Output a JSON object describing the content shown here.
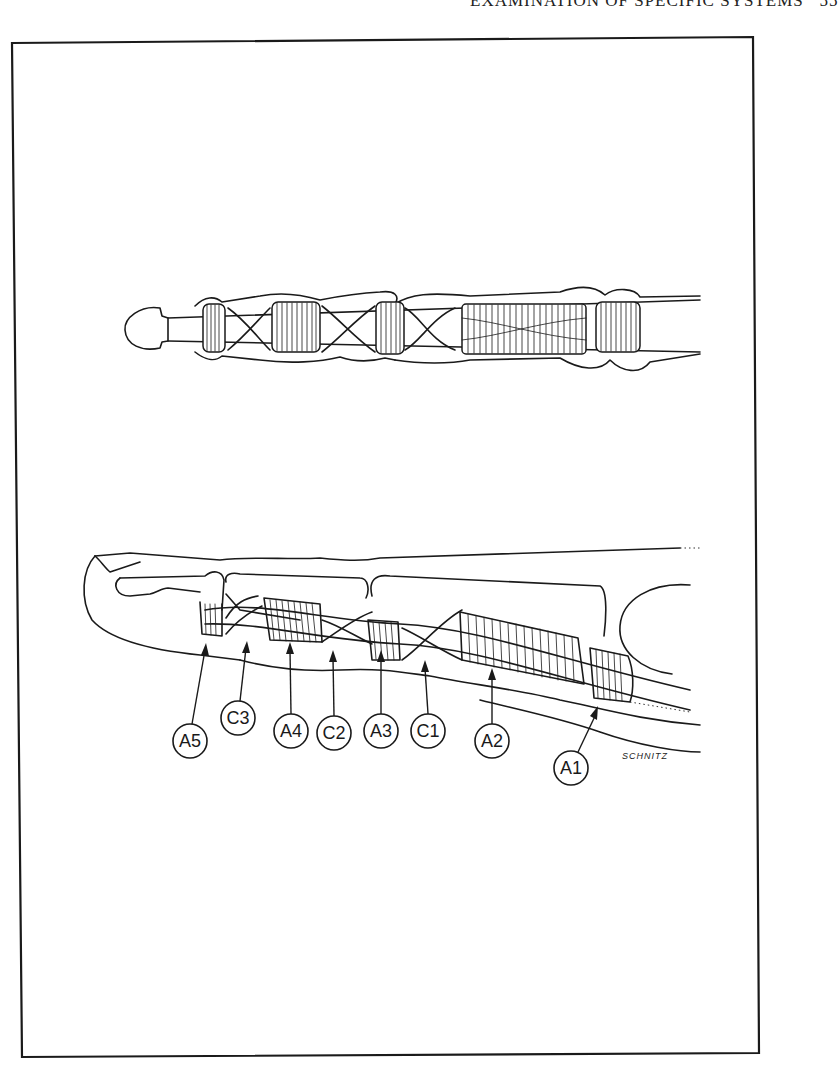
{
  "page": {
    "header_fragment": "EXAMINATION OF SPECIFIC SYSTEMS",
    "page_number_fragment": "55"
  },
  "figure": {
    "top_view": {
      "description": "Palmar view of finger flexor tendon sheath pulleys"
    },
    "lateral_view": {
      "description": "Lateral view of finger flexor sheath with annular and cruciate pulleys",
      "labels": [
        {
          "id": "A5",
          "text": "A5",
          "cx": 190,
          "cy": 741,
          "tip_x": 206,
          "tip_y": 645
        },
        {
          "id": "C3",
          "text": "C3",
          "cx": 238,
          "cy": 718,
          "tip_x": 246,
          "tip_y": 641
        },
        {
          "id": "A4",
          "text": "A4",
          "cx": 291,
          "cy": 731,
          "tip_x": 290,
          "tip_y": 642
        },
        {
          "id": "C2",
          "text": "C2",
          "cx": 334,
          "cy": 733,
          "tip_x": 333,
          "tip_y": 650
        },
        {
          "id": "A3",
          "text": "A3",
          "cx": 381,
          "cy": 731,
          "tip_x": 381,
          "tip_y": 650
        },
        {
          "id": "C1",
          "text": "C1",
          "cx": 428,
          "cy": 731,
          "tip_x": 425,
          "tip_y": 660
        },
        {
          "id": "A2",
          "text": "A2",
          "cx": 492,
          "cy": 741,
          "tip_x": 492,
          "tip_y": 668
        },
        {
          "id": "A1",
          "text": "A1",
          "cx": 571,
          "cy": 768,
          "tip_x": 597,
          "tip_y": 707
        }
      ]
    },
    "signature": "SCHNITZ"
  }
}
